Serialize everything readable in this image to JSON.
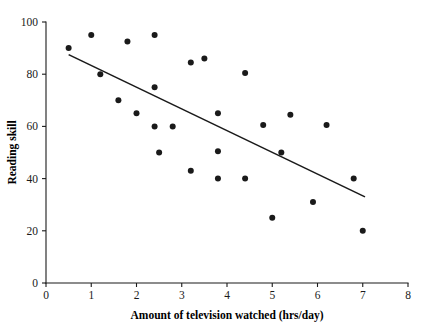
{
  "chart_data": {
    "type": "scatter",
    "title": "",
    "xlabel": "Amount of television watched (hrs/day)",
    "ylabel": "Reading skill",
    "xlim": [
      0,
      8
    ],
    "ylim": [
      0,
      100
    ],
    "xticks": [
      0,
      1,
      2,
      3,
      4,
      5,
      6,
      7,
      8
    ],
    "yticks": [
      0,
      20,
      40,
      60,
      80,
      100
    ],
    "xtick_labels": [
      "0",
      "1",
      "2",
      "3",
      "4",
      "5",
      "6",
      "7",
      "8"
    ],
    "ytick_labels": [
      "0",
      "20",
      "40",
      "60",
      "80",
      "100"
    ],
    "grid": false,
    "legend": null,
    "legend_position": "none",
    "marker": "filled-circle",
    "marker_color": "#1a1a1a",
    "marker_size_px": 3.0,
    "points": [
      {
        "x": 0.5,
        "y": 90
      },
      {
        "x": 1.0,
        "y": 95
      },
      {
        "x": 1.2,
        "y": 80
      },
      {
        "x": 1.6,
        "y": 70
      },
      {
        "x": 1.8,
        "y": 92.5
      },
      {
        "x": 2.0,
        "y": 65
      },
      {
        "x": 2.4,
        "y": 95
      },
      {
        "x": 2.4,
        "y": 75
      },
      {
        "x": 2.4,
        "y": 60
      },
      {
        "x": 2.5,
        "y": 50
      },
      {
        "x": 2.8,
        "y": 60
      },
      {
        "x": 3.2,
        "y": 84.5
      },
      {
        "x": 3.2,
        "y": 43
      },
      {
        "x": 3.5,
        "y": 86
      },
      {
        "x": 3.8,
        "y": 65
      },
      {
        "x": 3.8,
        "y": 50.5
      },
      {
        "x": 3.8,
        "y": 40
      },
      {
        "x": 4.4,
        "y": 80.5
      },
      {
        "x": 4.4,
        "y": 40
      },
      {
        "x": 4.8,
        "y": 60.5
      },
      {
        "x": 5.0,
        "y": 25
      },
      {
        "x": 5.2,
        "y": 50
      },
      {
        "x": 5.4,
        "y": 64.5
      },
      {
        "x": 5.9,
        "y": 31
      },
      {
        "x": 6.2,
        "y": 60.5
      },
      {
        "x": 6.8,
        "y": 40
      },
      {
        "x": 7.0,
        "y": 20
      }
    ],
    "trendline": {
      "type": "linear-fit",
      "x_start": 0.5,
      "y_start": 87.5,
      "x_end": 7.05,
      "y_end": 33.0,
      "color": "#1a1a1a"
    },
    "axis_color": "#1a1a1a",
    "background_color": "#ffffff"
  }
}
